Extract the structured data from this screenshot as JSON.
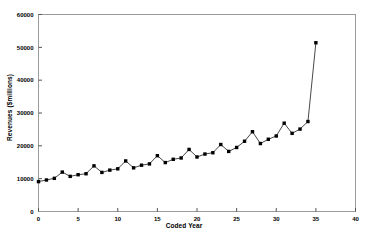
{
  "chart_data": {
    "type": "line",
    "title": "",
    "xlabel": "Coded Year",
    "ylabel": "Revenues ($millions)",
    "xlim": [
      0,
      40
    ],
    "ylim": [
      0,
      60000
    ],
    "xticks": [
      0,
      5,
      10,
      15,
      20,
      25,
      30,
      35,
      40
    ],
    "xtick_labels": [
      "0",
      "5",
      "10",
      "15",
      "20",
      "25",
      "30",
      "35",
      "40"
    ],
    "yticks": [
      0,
      10000,
      20000,
      30000,
      40000,
      50000,
      60000
    ],
    "ytick_labels": [
      "0",
      "10000",
      "20000",
      "30000",
      "40000",
      "50000",
      "60000"
    ],
    "grid": false,
    "legend": null,
    "marker": "filled-square",
    "line_color": "#333333",
    "marker_color": "#000000",
    "x": [
      0,
      1,
      2,
      3,
      4,
      5,
      6,
      7,
      8,
      9,
      10,
      11,
      12,
      13,
      14,
      15,
      16,
      17,
      18,
      19,
      20,
      21,
      22,
      23,
      24,
      25,
      26,
      27,
      28,
      29,
      30,
      31,
      32,
      33,
      34,
      35
    ],
    "values": [
      9100,
      9600,
      10100,
      12000,
      10700,
      11200,
      11500,
      13900,
      11900,
      12600,
      13000,
      15400,
      13300,
      14100,
      14500,
      17000,
      14900,
      15900,
      16300,
      18900,
      16600,
      17500,
      17900,
      20400,
      18300,
      19500,
      21400,
      24300,
      20700,
      22000,
      23000,
      26900,
      23800,
      25100,
      27400,
      51400
    ],
    "series": [
      {
        "name": "Revenues",
        "values": [
          9100,
          9600,
          10100,
          12000,
          10700,
          11200,
          11500,
          13900,
          11900,
          12600,
          13000,
          15400,
          13300,
          14100,
          14500,
          17000,
          14900,
          15900,
          16300,
          18900,
          16600,
          17500,
          17900,
          20400,
          18300,
          19500,
          21400,
          24300,
          20700,
          22000,
          23000,
          26900,
          23800,
          25100,
          27400,
          51400
        ]
      }
    ]
  },
  "axes": {
    "x_title": "Coded Year",
    "y_title": "Revenues ($millions)"
  }
}
